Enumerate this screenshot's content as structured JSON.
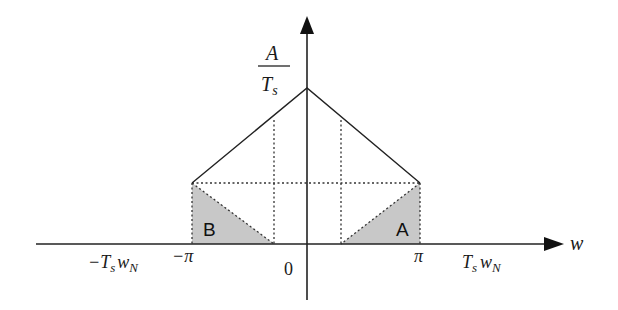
{
  "diagram": {
    "type": "spectrum-aliasing-sketch",
    "y_axis_label": {
      "numerator": "A",
      "denominator": "T",
      "subscript": "s"
    },
    "x_axis_label": "w",
    "x_ticks": [
      {
        "id": "neg_tswn",
        "text": "−T",
        "sub1": "s",
        "mid": "w",
        "sub2": "N"
      },
      {
        "id": "neg_pi",
        "text": "−π"
      },
      {
        "id": "zero",
        "text": "0"
      },
      {
        "id": "pi",
        "text": "π"
      },
      {
        "id": "tswn",
        "text": "T",
        "sub1": "s",
        "mid": "w",
        "sub2": "N"
      }
    ],
    "regions": [
      {
        "label": "B",
        "side": "left",
        "fill": "#c8c8c8"
      },
      {
        "label": "A",
        "side": "right",
        "fill": "#c8c8c8"
      }
    ],
    "colors": {
      "line": "#222222",
      "dotted": "#333333",
      "shade": "#c8c8c8"
    }
  }
}
